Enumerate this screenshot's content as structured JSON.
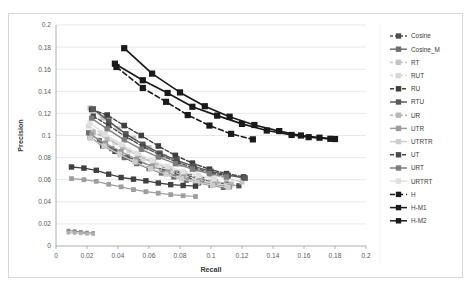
{
  "chart_data": {
    "type": "line",
    "title": "",
    "xlabel": "Recall",
    "ylabel": "Precision",
    "xlim": [
      0,
      0.2
    ],
    "ylim": [
      0,
      0.2
    ],
    "xticks": [
      "0",
      "0.02",
      "0.04",
      "0.06",
      "0.08",
      "0.1",
      "0.12",
      "0.14",
      "0.16",
      "0.18",
      "0.2"
    ],
    "yticks": [
      "0",
      "0.02",
      "0.04",
      "0.06",
      "0.08",
      "0.1",
      "0.12",
      "0.14",
      "0.16",
      "0.18",
      "0.2"
    ],
    "grid": "horizontal",
    "legend_position": "right",
    "marker": "square",
    "series": [
      {
        "name": "Cosine",
        "color": "#4f4f4f",
        "dash": "3,2",
        "width": 1.3,
        "marker_size": 2.6,
        "points": [
          [
            0.022,
            0.0985
          ],
          [
            0.03,
            0.0905
          ],
          [
            0.038,
            0.0855
          ],
          [
            0.046,
            0.0805
          ],
          [
            0.054,
            0.0765
          ],
          [
            0.062,
            0.072
          ],
          [
            0.07,
            0.069
          ],
          [
            0.078,
            0.066
          ],
          [
            0.086,
            0.063
          ],
          [
            0.094,
            0.06
          ],
          [
            0.102,
            0.058
          ],
          [
            0.11,
            0.056
          ],
          [
            0.118,
            0.0545
          ]
        ]
      },
      {
        "name": "Cosine_M",
        "color": "#6e6e6e",
        "dash": "none",
        "width": 1.2,
        "marker_size": 2.6,
        "points": [
          [
            0.021,
            0.1025
          ],
          [
            0.028,
            0.0955
          ],
          [
            0.036,
            0.088
          ],
          [
            0.044,
            0.08
          ],
          [
            0.052,
            0.0745
          ],
          [
            0.06,
            0.07
          ],
          [
            0.068,
            0.066
          ],
          [
            0.076,
            0.0625
          ],
          [
            0.084,
            0.0595
          ],
          [
            0.092,
            0.057
          ],
          [
            0.1,
            0.0548
          ],
          [
            0.108,
            0.053
          ]
        ]
      },
      {
        "name": "RT",
        "color": "#c4c4c4",
        "dash": "3,2",
        "width": 1.2,
        "marker_size": 2.6,
        "points": [
          [
            0.022,
            0.125
          ],
          [
            0.03,
            0.116
          ],
          [
            0.04,
            0.106
          ],
          [
            0.05,
            0.0975
          ],
          [
            0.06,
            0.089
          ],
          [
            0.07,
            0.081
          ],
          [
            0.08,
            0.074
          ],
          [
            0.09,
            0.069
          ],
          [
            0.1,
            0.0645
          ],
          [
            0.11,
            0.061
          ],
          [
            0.12,
            0.058
          ]
        ]
      },
      {
        "name": "RUT",
        "color": "#d8d8d8",
        "dash": "3,2",
        "width": 1.2,
        "marker_size": 2.6,
        "points": [
          [
            0.021,
            0.1085
          ],
          [
            0.029,
            0.102
          ],
          [
            0.038,
            0.0935
          ],
          [
            0.047,
            0.086
          ],
          [
            0.056,
            0.079
          ],
          [
            0.065,
            0.0725
          ],
          [
            0.074,
            0.068
          ],
          [
            0.083,
            0.0635
          ],
          [
            0.092,
            0.06
          ],
          [
            0.101,
            0.057
          ],
          [
            0.11,
            0.0548
          ]
        ]
      },
      {
        "name": "RU",
        "color": "#3f3f3f",
        "dash": "4,2",
        "width": 1.4,
        "marker_size": 2.8,
        "points": [
          [
            0.023,
            0.1235
          ],
          [
            0.033,
            0.1185
          ],
          [
            0.044,
            0.109
          ],
          [
            0.055,
            0.1
          ],
          [
            0.066,
            0.0905
          ],
          [
            0.077,
            0.082
          ],
          [
            0.088,
            0.075
          ],
          [
            0.099,
            0.0695
          ],
          [
            0.11,
            0.0655
          ],
          [
            0.121,
            0.0625
          ]
        ]
      },
      {
        "name": "RTU",
        "color": "#595959",
        "dash": "none",
        "width": 1.4,
        "marker_size": 2.8,
        "points": [
          [
            0.024,
            0.124
          ],
          [
            0.034,
            0.113
          ],
          [
            0.045,
            0.1015
          ],
          [
            0.056,
            0.092
          ],
          [
            0.067,
            0.084
          ],
          [
            0.078,
            0.0775
          ],
          [
            0.089,
            0.072
          ],
          [
            0.1,
            0.0675
          ],
          [
            0.111,
            0.064
          ],
          [
            0.122,
            0.0615
          ]
        ]
      },
      {
        "name": "UR",
        "color": "#b8b8b8",
        "dash": "3,2",
        "width": 1.2,
        "marker_size": 2.6,
        "points": [
          [
            0.024,
            0.103
          ],
          [
            0.033,
            0.097
          ],
          [
            0.043,
            0.0895
          ],
          [
            0.053,
            0.082
          ],
          [
            0.063,
            0.0755
          ],
          [
            0.073,
            0.07
          ],
          [
            0.083,
            0.0655
          ],
          [
            0.093,
            0.0615
          ],
          [
            0.103,
            0.0585
          ],
          [
            0.113,
            0.056
          ]
        ]
      },
      {
        "name": "UTR",
        "color": "#9a9a9a",
        "dash": "none",
        "width": 1.2,
        "marker_size": 2.6,
        "points": [
          [
            0.023,
            0.1005
          ],
          [
            0.032,
            0.093
          ],
          [
            0.042,
            0.0855
          ],
          [
            0.052,
            0.0785
          ],
          [
            0.062,
            0.072
          ],
          [
            0.072,
            0.0665
          ],
          [
            0.082,
            0.062
          ],
          [
            0.092,
            0.0585
          ],
          [
            0.102,
            0.0555
          ],
          [
            0.112,
            0.0535
          ]
        ]
      },
      {
        "name": "UTRTR",
        "color": "#cdcdcd",
        "dash": "none",
        "width": 1.2,
        "marker_size": 2.6,
        "points": [
          [
            0.022,
            0.0975
          ],
          [
            0.031,
            0.0905
          ],
          [
            0.041,
            0.083
          ],
          [
            0.051,
            0.076
          ],
          [
            0.061,
            0.07
          ],
          [
            0.071,
            0.065
          ],
          [
            0.081,
            0.0608
          ],
          [
            0.091,
            0.0575
          ],
          [
            0.101,
            0.055
          ],
          [
            0.111,
            0.053
          ]
        ]
      },
      {
        "name": "UT",
        "color": "#4a4a4a",
        "dash": "4,2",
        "width": 1.3,
        "marker_size": 2.7,
        "points": [
          [
            0.024,
            0.1175
          ],
          [
            0.034,
            0.109
          ],
          [
            0.045,
            0.099
          ],
          [
            0.056,
            0.09
          ],
          [
            0.067,
            0.0825
          ],
          [
            0.078,
            0.076
          ],
          [
            0.089,
            0.0705
          ],
          [
            0.1,
            0.0665
          ],
          [
            0.111,
            0.0635
          ]
        ]
      },
      {
        "name": "URT",
        "color": "#7d7d7d",
        "dash": "none",
        "width": 1.3,
        "marker_size": 2.7,
        "points": [
          [
            0.023,
            0.1155
          ],
          [
            0.033,
            0.106
          ],
          [
            0.044,
            0.096
          ],
          [
            0.055,
            0.0875
          ],
          [
            0.066,
            0.0805
          ],
          [
            0.077,
            0.0745
          ],
          [
            0.088,
            0.0695
          ],
          [
            0.099,
            0.0655
          ],
          [
            0.11,
            0.0625
          ]
        ]
      },
      {
        "name": "URTRT",
        "color": "#e0e0e0",
        "dash": "none",
        "width": 1.3,
        "marker_size": 2.7,
        "points": [
          [
            0.022,
            0.111
          ],
          [
            0.032,
            0.101
          ],
          [
            0.042,
            0.092
          ],
          [
            0.052,
            0.084
          ],
          [
            0.062,
            0.0775
          ],
          [
            0.072,
            0.072
          ],
          [
            0.082,
            0.0675
          ],
          [
            0.092,
            0.064
          ],
          [
            0.102,
            0.061
          ]
        ]
      },
      {
        "name": "H",
        "color": "#1a1a1a",
        "dash": "5,3",
        "width": 1.6,
        "marker_size": 3.1,
        "points": [
          [
            0.039,
            0.162
          ],
          [
            0.056,
            0.143
          ],
          [
            0.071,
            0.1305
          ],
          [
            0.085,
            0.1185
          ],
          [
            0.099,
            0.109
          ],
          [
            0.113,
            0.1015
          ],
          [
            0.127,
            0.0965
          ]
        ]
      },
      {
        "name": "H-M1",
        "color": "#1a1a1a",
        "dash": "none",
        "width": 1.7,
        "marker_size": 3.1,
        "points": [
          [
            0.038,
            0.165
          ],
          [
            0.056,
            0.15
          ],
          [
            0.072,
            0.1385
          ],
          [
            0.088,
            0.126
          ],
          [
            0.104,
            0.118
          ],
          [
            0.12,
            0.1105
          ],
          [
            0.136,
            0.1045
          ],
          [
            0.152,
            0.1005
          ],
          [
            0.163,
            0.0985
          ],
          [
            0.177,
            0.097
          ]
        ]
      },
      {
        "name": "H-M2",
        "color": "#1a1a1a",
        "dash": "none",
        "width": 1.7,
        "marker_size": 3.1,
        "points": [
          [
            0.044,
            0.179
          ],
          [
            0.062,
            0.156
          ],
          [
            0.08,
            0.139
          ],
          [
            0.096,
            0.1265
          ],
          [
            0.112,
            0.117
          ],
          [
            0.128,
            0.1095
          ],
          [
            0.144,
            0.104
          ],
          [
            0.158,
            0.1
          ],
          [
            0.17,
            0.098
          ],
          [
            0.18,
            0.0968
          ]
        ]
      },
      {
        "name": "cluster-a",
        "color": "#8a8a8a",
        "dash": "none",
        "width": 1.1,
        "marker_size": 1.8,
        "points": [
          [
            0.008,
            0.014
          ],
          [
            0.012,
            0.0135
          ],
          [
            0.016,
            0.0128
          ],
          [
            0.02,
            0.0122
          ],
          [
            0.024,
            0.0118
          ]
        ]
      },
      {
        "name": "cluster-b",
        "color": "#b0b0b0",
        "dash": "none",
        "width": 1.1,
        "marker_size": 1.8,
        "points": [
          [
            0.008,
            0.012
          ],
          [
            0.012,
            0.0118
          ],
          [
            0.016,
            0.0115
          ],
          [
            0.02,
            0.011
          ],
          [
            0.024,
            0.0108
          ]
        ]
      },
      {
        "name": "low-dark",
        "color": "#3f3f3f",
        "dash": "none",
        "width": 1.3,
        "marker_size": 2.7,
        "points": [
          [
            0.01,
            0.0715
          ],
          [
            0.018,
            0.0705
          ],
          [
            0.026,
            0.0685
          ],
          [
            0.034,
            0.065
          ],
          [
            0.042,
            0.062
          ],
          [
            0.05,
            0.0605
          ],
          [
            0.058,
            0.059
          ],
          [
            0.066,
            0.057
          ],
          [
            0.074,
            0.0555
          ],
          [
            0.082,
            0.0548
          ],
          [
            0.09,
            0.0542
          ]
        ]
      },
      {
        "name": "low-light",
        "color": "#9e9e9e",
        "dash": "none",
        "width": 1.2,
        "marker_size": 2.4,
        "points": [
          [
            0.01,
            0.061
          ],
          [
            0.018,
            0.06
          ],
          [
            0.026,
            0.0585
          ],
          [
            0.034,
            0.0558
          ],
          [
            0.042,
            0.0535
          ],
          [
            0.05,
            0.051
          ],
          [
            0.058,
            0.0492
          ],
          [
            0.066,
            0.0478
          ],
          [
            0.074,
            0.0465
          ],
          [
            0.082,
            0.0455
          ],
          [
            0.09,
            0.0448
          ]
        ]
      }
    ],
    "legend_entries": [
      {
        "label": "Cosine",
        "color": "#4f4f4f",
        "dash": "3,2",
        "marker": true
      },
      {
        "label": "Cosine_M",
        "color": "#6e6e6e",
        "dash": "none",
        "marker": true
      },
      {
        "label": "RT",
        "color": "#c4c4c4",
        "dash": "3,2",
        "marker": true
      },
      {
        "label": "RUT",
        "color": "#d8d8d8",
        "dash": "3,2",
        "marker": true
      },
      {
        "label": "RU",
        "color": "#3f3f3f",
        "dash": "4,2",
        "marker": true
      },
      {
        "label": "RTU",
        "color": "#595959",
        "dash": "none",
        "marker": true
      },
      {
        "label": "UR",
        "color": "#b8b8b8",
        "dash": "3,2",
        "marker": true
      },
      {
        "label": "UTR",
        "color": "#9a9a9a",
        "dash": "none",
        "marker": true
      },
      {
        "label": "UTRTR",
        "color": "#cdcdcd",
        "dash": "none",
        "marker": true
      },
      {
        "label": "UT",
        "color": "#4a4a4a",
        "dash": "4,2",
        "marker": true
      },
      {
        "label": "URT",
        "color": "#7d7d7d",
        "dash": "none",
        "marker": true
      },
      {
        "label": "URTRT",
        "color": "#e0e0e0",
        "dash": "none",
        "marker": true
      },
      {
        "label": "H",
        "color": "#1a1a1a",
        "dash": "5,3",
        "marker": true
      },
      {
        "label": "H-M1",
        "color": "#1a1a1a",
        "dash": "none",
        "marker": true
      },
      {
        "label": "H-M2",
        "color": "#1a1a1a",
        "dash": "none",
        "marker": true
      }
    ]
  }
}
